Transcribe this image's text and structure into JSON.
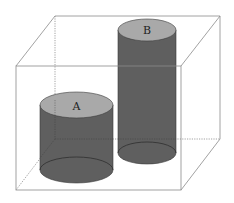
{
  "diagram": {
    "colors": {
      "box_edge": "#8a8a8a",
      "cylinder_body": "#5f5f5f",
      "cylinder_top": "#a9a9a9",
      "cylinder_outline": "#3a3a3a"
    },
    "cylinders": [
      {
        "label": "A"
      },
      {
        "label": "B"
      }
    ]
  }
}
